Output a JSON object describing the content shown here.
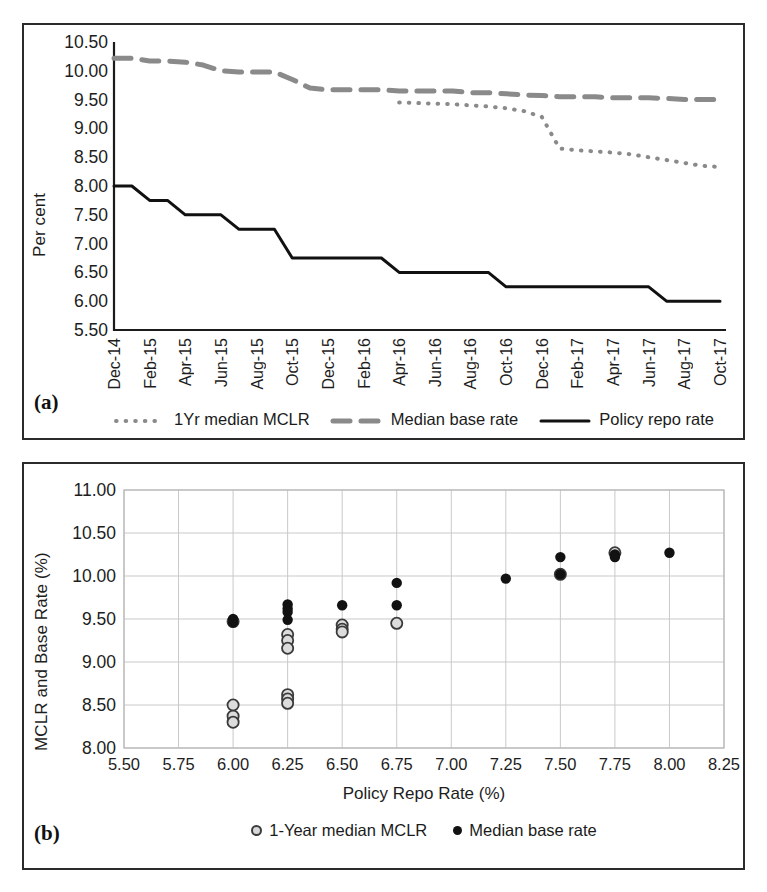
{
  "figure": {
    "panel_a_tag": "(a)",
    "panel_b_tag": "(b)"
  },
  "panel_a": {
    "ylabel": "Per cent",
    "yticks": [
      "10.50",
      "10.00",
      "9.50",
      "9.00",
      "8.50",
      "8.00",
      "7.50",
      "7.00",
      "6.50",
      "6.00",
      "5.50"
    ],
    "xticks": [
      "Dec-14",
      "Feb-15",
      "Apr-15",
      "Jun-15",
      "Aug-15",
      "Oct-15",
      "Dec-15",
      "Feb-16",
      "Apr-16",
      "Jun-16",
      "Aug-16",
      "Oct-16",
      "Dec-16",
      "Feb-17",
      "Apr-17",
      "Jun-17",
      "Aug-17",
      "Oct-17"
    ],
    "legend": [
      {
        "label": "1Yr median MCLR",
        "style": "dotted",
        "color": "#8a8a8a"
      },
      {
        "label": "Median base rate",
        "style": "dashed",
        "color": "#8a8a8a"
      },
      {
        "label": "Policy repo rate",
        "style": "solid",
        "color": "#111111"
      }
    ]
  },
  "panel_b": {
    "ylabel": "MCLR and Base Rate (%)",
    "xlabel": "Policy Repo Rate (%)",
    "yticks": [
      "11.00",
      "10.50",
      "10.00",
      "9.50",
      "9.00",
      "8.50",
      "8.00"
    ],
    "xticks": [
      "5.50",
      "5.75",
      "6.00",
      "6.25",
      "6.50",
      "6.75",
      "7.00",
      "7.25",
      "7.50",
      "7.75",
      "8.00",
      "8.25"
    ],
    "legend": [
      {
        "label": "1-Year median MCLR",
        "marker": "hollow-circle"
      },
      {
        "label": "Median base rate",
        "marker": "filled-circle"
      }
    ]
  },
  "chart_data": [
    {
      "type": "line",
      "id": "panel-a",
      "title": "",
      "xlabel": "",
      "ylabel": "Per cent",
      "ylim": [
        5.5,
        10.5
      ],
      "grid": false,
      "legend_position": "below-axis",
      "categories": [
        "Dec-14",
        "Jan-15",
        "Feb-15",
        "Mar-15",
        "Apr-15",
        "May-15",
        "Jun-15",
        "Jul-15",
        "Aug-15",
        "Sep-15",
        "Oct-15",
        "Nov-15",
        "Dec-15",
        "Jan-16",
        "Feb-16",
        "Mar-16",
        "Apr-16",
        "May-16",
        "Jun-16",
        "Jul-16",
        "Aug-16",
        "Sep-16",
        "Oct-16",
        "Nov-16",
        "Dec-16",
        "Jan-17",
        "Feb-17",
        "Mar-17",
        "Apr-17",
        "May-17",
        "Jun-17",
        "Jul-17",
        "Aug-17",
        "Sep-17",
        "Oct-17"
      ],
      "series": [
        {
          "name": "Policy repo rate",
          "style": "solid",
          "color": "#111111",
          "values": [
            8.0,
            8.0,
            7.75,
            7.75,
            7.5,
            7.5,
            7.5,
            7.25,
            7.25,
            7.25,
            6.75,
            6.75,
            6.75,
            6.75,
            6.75,
            6.75,
            6.5,
            6.5,
            6.5,
            6.5,
            6.5,
            6.5,
            6.25,
            6.25,
            6.25,
            6.25,
            6.25,
            6.25,
            6.25,
            6.25,
            6.25,
            6.0,
            6.0,
            6.0,
            6.0
          ]
        },
        {
          "name": "Median base rate",
          "style": "dashed",
          "color": "#8a8a8a",
          "values": [
            10.22,
            10.22,
            10.17,
            10.17,
            10.15,
            10.1,
            10.0,
            9.98,
            9.98,
            9.98,
            9.85,
            9.7,
            9.67,
            9.67,
            9.67,
            9.67,
            9.65,
            9.65,
            9.65,
            9.65,
            9.62,
            9.62,
            9.6,
            9.58,
            9.57,
            9.55,
            9.55,
            9.55,
            9.53,
            9.53,
            9.53,
            9.52,
            9.5,
            9.5,
            9.5
          ]
        },
        {
          "name": "1Yr median MCLR",
          "style": "dotted",
          "color": "#8a8a8a",
          "values": [
            null,
            null,
            null,
            null,
            null,
            null,
            null,
            null,
            null,
            null,
            null,
            null,
            null,
            null,
            null,
            null,
            9.45,
            9.44,
            9.43,
            9.42,
            9.4,
            9.38,
            9.35,
            9.3,
            9.2,
            8.65,
            8.62,
            8.6,
            8.58,
            8.55,
            8.5,
            8.45,
            8.4,
            8.35,
            8.33
          ]
        }
      ]
    },
    {
      "type": "scatter",
      "id": "panel-b",
      "title": "",
      "xlabel": "Policy Repo Rate (%)",
      "ylabel": "MCLR and Base Rate (%)",
      "xlim": [
        5.5,
        8.25
      ],
      "ylim": [
        8.0,
        11.0
      ],
      "grid": true,
      "legend_position": "below-axis",
      "series": [
        {
          "name": "1-Year median MCLR",
          "marker": "hollow-circle",
          "points": [
            {
              "x": 6.0,
              "y": 8.5
            },
            {
              "x": 6.0,
              "y": 8.37
            },
            {
              "x": 6.0,
              "y": 8.3
            },
            {
              "x": 6.0,
              "y": 9.47
            },
            {
              "x": 6.25,
              "y": 8.62
            },
            {
              "x": 6.25,
              "y": 8.57
            },
            {
              "x": 6.25,
              "y": 8.52
            },
            {
              "x": 6.25,
              "y": 9.32
            },
            {
              "x": 6.25,
              "y": 9.25
            },
            {
              "x": 6.25,
              "y": 9.16
            },
            {
              "x": 6.5,
              "y": 9.43
            },
            {
              "x": 6.5,
              "y": 9.38
            },
            {
              "x": 6.5,
              "y": 9.35
            },
            {
              "x": 6.75,
              "y": 9.45
            },
            {
              "x": 7.5,
              "y": 10.02
            },
            {
              "x": 7.75,
              "y": 10.27
            }
          ]
        },
        {
          "name": "Median base rate",
          "marker": "filled-circle",
          "points": [
            {
              "x": 6.0,
              "y": 9.5
            },
            {
              "x": 6.0,
              "y": 9.46
            },
            {
              "x": 6.25,
              "y": 9.67
            },
            {
              "x": 6.25,
              "y": 9.62
            },
            {
              "x": 6.25,
              "y": 9.58
            },
            {
              "x": 6.25,
              "y": 9.49
            },
            {
              "x": 6.5,
              "y": 9.66
            },
            {
              "x": 6.75,
              "y": 9.92
            },
            {
              "x": 6.75,
              "y": 9.66
            },
            {
              "x": 7.25,
              "y": 9.97
            },
            {
              "x": 7.5,
              "y": 10.22
            },
            {
              "x": 7.5,
              "y": 10.02
            },
            {
              "x": 7.75,
              "y": 10.25
            },
            {
              "x": 7.75,
              "y": 10.22
            },
            {
              "x": 8.0,
              "y": 10.27
            }
          ]
        }
      ]
    }
  ]
}
